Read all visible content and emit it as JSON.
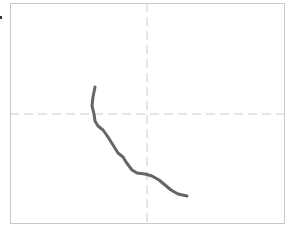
{
  "diagram": {
    "type": "trajectory-plot",
    "frame": {
      "left": 10,
      "top": 3,
      "right": 285,
      "bottom": 224,
      "border_color": "#c8c8c8"
    },
    "crosshair": {
      "x": 147,
      "y": 114,
      "color": "#cccccc",
      "style": "dashed"
    },
    "curve": {
      "color": "#666666",
      "width": 3,
      "points": [
        [
          95,
          87
        ],
        [
          93,
          97
        ],
        [
          92,
          106
        ],
        [
          94,
          114
        ],
        [
          95,
          121
        ],
        [
          98,
          126
        ],
        [
          103,
          130
        ],
        [
          108,
          137
        ],
        [
          113,
          145
        ],
        [
          118,
          153
        ],
        [
          123,
          157
        ],
        [
          126,
          162
        ],
        [
          132,
          170
        ],
        [
          137,
          173
        ],
        [
          145,
          174
        ],
        [
          152,
          176
        ],
        [
          159,
          180
        ],
        [
          165,
          185
        ],
        [
          171,
          190
        ],
        [
          178,
          194
        ],
        [
          187,
          196
        ]
      ]
    }
  }
}
